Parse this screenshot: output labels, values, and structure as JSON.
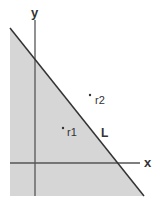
{
  "diagram": {
    "axes": {
      "x_label": "x",
      "y_label": "y"
    },
    "line": {
      "label": "L"
    },
    "points": [
      {
        "label": "r1",
        "side": "shaded (below L)"
      },
      {
        "label": "r2",
        "side": "unshaded (above L)"
      }
    ],
    "colors": {
      "shade": "#d6d6d6",
      "line": "#333333",
      "axis": "#555555"
    }
  }
}
